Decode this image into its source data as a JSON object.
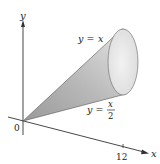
{
  "diagram": {
    "type": "3d-solid-of-revolution",
    "axes": {
      "x_label": "x",
      "y_label": "y",
      "origin_label": "0",
      "x_tick_label": "12"
    },
    "curves": [
      {
        "id": "upper",
        "label_lhs": "y =",
        "label_rhs": "x"
      },
      {
        "id": "lower",
        "label_lhs": "y =",
        "label_num": "x",
        "label_den": "2"
      }
    ],
    "colors": {
      "axis": "#333333",
      "cone_dark": "#8a8a8a",
      "cone_light": "#e6e6e6",
      "opening": "#ececec",
      "text": "#222222"
    }
  }
}
